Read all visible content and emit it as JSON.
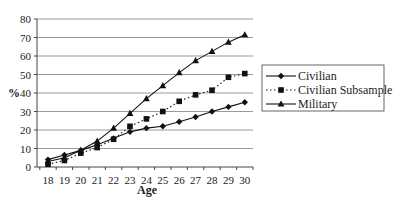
{
  "chart_data": {
    "type": "line",
    "title": "",
    "xlabel": "Age",
    "ylabel": "%",
    "x": [
      18,
      19,
      20,
      21,
      22,
      23,
      24,
      25,
      26,
      27,
      28,
      29,
      30
    ],
    "ylim": [
      0,
      80
    ],
    "yticks": [
      0,
      10,
      20,
      30,
      40,
      50,
      60,
      70,
      80
    ],
    "grid": "horizontal",
    "legend_position": "right",
    "series": [
      {
        "name": "Civilian",
        "marker": "diamond",
        "line": "solid",
        "values": [
          4,
          6.5,
          9,
          12,
          15.5,
          19,
          21,
          22,
          24.5,
          27,
          30,
          32.5,
          35
        ]
      },
      {
        "name": "Civilian Subsample",
        "marker": "square",
        "line": "dotted",
        "values": [
          1.5,
          3.5,
          7.5,
          10.5,
          15,
          22,
          26,
          30,
          35.5,
          39,
          41.5,
          48.5,
          50.5
        ]
      },
      {
        "name": "Military",
        "marker": "triangle",
        "line": "solid",
        "values": [
          3,
          5,
          9,
          14,
          21,
          29,
          37,
          44,
          51,
          57.5,
          62.5,
          67.5,
          71.5
        ]
      }
    ]
  },
  "colors": {
    "line": "#111111",
    "grid": "#9a9a9a",
    "axis": "#444444"
  }
}
